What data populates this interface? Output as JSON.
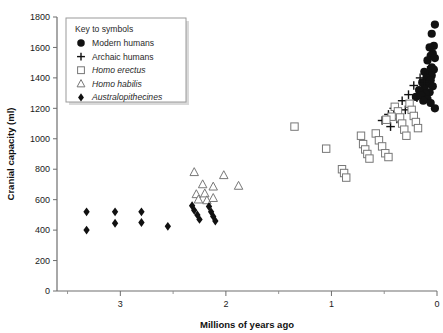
{
  "chart_data": {
    "type": "scatter",
    "title": "",
    "xlabel": "Millions of years ago",
    "ylabel": "Cranial capacity (ml)",
    "xlim": [
      3.6,
      0.0
    ],
    "ylim": [
      0,
      1800
    ],
    "x_reversed": true,
    "xticks": [
      3,
      2,
      1,
      0
    ],
    "xtick_labels": [
      "3",
      "2",
      "1",
      "0"
    ],
    "x_minor_ticks": [
      3.5,
      2.5,
      1.5,
      0.5
    ],
    "yticks": [
      0,
      200,
      400,
      600,
      800,
      1000,
      1200,
      1400,
      1600,
      1800
    ],
    "ytick_labels": [
      "0",
      "200",
      "400",
      "600",
      "800",
      "1000",
      "1200",
      "1400",
      "1600",
      "1800"
    ],
    "grid": false,
    "legend_position": "top-left",
    "legend_title": "Key to symbols",
    "series": [
      {
        "name": "Modern humans",
        "marker": "filled-circle",
        "color": "#111111",
        "italic": false,
        "points": [
          [
            0.02,
            1750
          ],
          [
            0.05,
            1690
          ],
          [
            0.03,
            1610
          ],
          [
            0.07,
            1600
          ],
          [
            0.04,
            1560
          ],
          [
            0.06,
            1545
          ],
          [
            0.02,
            1530
          ],
          [
            0.09,
            1515
          ],
          [
            0.05,
            1470
          ],
          [
            0.03,
            1455
          ],
          [
            0.12,
            1440
          ],
          [
            0.08,
            1430
          ],
          [
            0.05,
            1415
          ],
          [
            0.1,
            1400
          ],
          [
            0.06,
            1385
          ],
          [
            0.14,
            1370
          ],
          [
            0.09,
            1360
          ],
          [
            0.04,
            1345
          ],
          [
            0.12,
            1330
          ],
          [
            0.17,
            1320
          ],
          [
            0.07,
            1305
          ],
          [
            0.11,
            1295
          ],
          [
            0.15,
            1285
          ],
          [
            0.2,
            1275
          ],
          [
            0.09,
            1260
          ],
          [
            0.13,
            1250
          ],
          [
            0.06,
            1235
          ],
          [
            0.02,
            1200
          ]
        ]
      },
      {
        "name": "Archaic humans",
        "marker": "plus",
        "color": "#111111",
        "italic": false,
        "points": [
          [
            0.05,
            1600
          ],
          [
            0.09,
            1450
          ],
          [
            0.16,
            1400
          ],
          [
            0.12,
            1375
          ],
          [
            0.22,
            1350
          ],
          [
            0.27,
            1290
          ],
          [
            0.19,
            1270
          ],
          [
            0.33,
            1250
          ],
          [
            0.41,
            1200
          ],
          [
            0.3,
            1190
          ],
          [
            0.46,
            1160
          ],
          [
            0.38,
            1130
          ],
          [
            0.52,
            1120
          ],
          [
            0.44,
            1080
          ]
        ]
      },
      {
        "name": "Homo erectus",
        "marker": "open-square",
        "color": "#777777",
        "italic": true,
        "points": [
          [
            1.35,
            1080
          ],
          [
            1.05,
            935
          ],
          [
            0.9,
            800
          ],
          [
            0.88,
            775
          ],
          [
            0.86,
            745
          ],
          [
            0.72,
            1020
          ],
          [
            0.7,
            965
          ],
          [
            0.68,
            930
          ],
          [
            0.66,
            900
          ],
          [
            0.64,
            870
          ],
          [
            0.58,
            1035
          ],
          [
            0.55,
            990
          ],
          [
            0.52,
            950
          ],
          [
            0.49,
            905
          ],
          [
            0.46,
            880
          ],
          [
            0.4,
            1210
          ],
          [
            0.37,
            1180
          ],
          [
            0.35,
            1140
          ],
          [
            0.33,
            1100
          ],
          [
            0.31,
            1060
          ],
          [
            0.29,
            1020
          ],
          [
            0.26,
            1230
          ],
          [
            0.24,
            1190
          ],
          [
            0.22,
            1150
          ],
          [
            0.2,
            1110
          ],
          [
            0.18,
            1070
          ],
          [
            0.43,
            1145
          ],
          [
            0.48,
            1125
          ]
        ]
      },
      {
        "name": "Homo habilis",
        "marker": "open-triangle",
        "color": "#777777",
        "italic": true,
        "points": [
          [
            2.3,
            780
          ],
          [
            2.02,
            760
          ],
          [
            2.22,
            700
          ],
          [
            2.12,
            685
          ],
          [
            1.88,
            690
          ],
          [
            2.28,
            635
          ],
          [
            2.2,
            640
          ],
          [
            2.26,
            600
          ],
          [
            2.18,
            595
          ],
          [
            2.12,
            610
          ]
        ]
      },
      {
        "name": "Australopithecines",
        "marker": "filled-diamond",
        "color": "#111111",
        "italic": true,
        "points": [
          [
            3.32,
            520
          ],
          [
            3.32,
            400
          ],
          [
            3.05,
            520
          ],
          [
            3.05,
            445
          ],
          [
            2.8,
            520
          ],
          [
            2.8,
            450
          ],
          [
            2.55,
            425
          ],
          [
            2.32,
            560
          ],
          [
            2.3,
            530
          ],
          [
            2.27,
            500
          ],
          [
            2.25,
            470
          ],
          [
            2.16,
            555
          ],
          [
            2.14,
            520
          ],
          [
            2.12,
            490
          ],
          [
            2.1,
            460
          ]
        ]
      }
    ]
  },
  "legend": {
    "title": "Key to symbols",
    "items": [
      {
        "label": "Modern humans",
        "marker": "filled-circle",
        "italic": false
      },
      {
        "label": "Archaic humans",
        "marker": "plus",
        "italic": false
      },
      {
        "label": "Homo erectus",
        "marker": "open-square",
        "italic": true
      },
      {
        "label": "Homo habilis",
        "marker": "open-triangle",
        "italic": true
      },
      {
        "label": "Australopithecines",
        "marker": "filled-diamond",
        "italic": true
      }
    ]
  },
  "axes": {
    "y_title": "Cranial capacity (ml)",
    "x_title": "Millions of years ago"
  },
  "colors": {
    "marker_filled": "#111111",
    "marker_open_stroke": "#777777",
    "axis": "#6e6e6e",
    "background": "#ffffff"
  }
}
